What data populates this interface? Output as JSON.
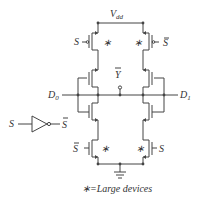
{
  "diagram": {
    "type": "cmos-multiplexer-circuit",
    "labels": {
      "supply": "V",
      "supply_sub": "dd",
      "output": "Y",
      "input_d0": "D",
      "input_d0_sub": "0",
      "input_d1": "D",
      "input_d1_sub": "1",
      "select": "S",
      "select_bar": "S",
      "inverter_in": "S",
      "inverter_out": "S",
      "large_mark": "∗",
      "legend": "=Large devices"
    },
    "colors": {
      "line": "#444444",
      "background": "#ffffff"
    }
  }
}
